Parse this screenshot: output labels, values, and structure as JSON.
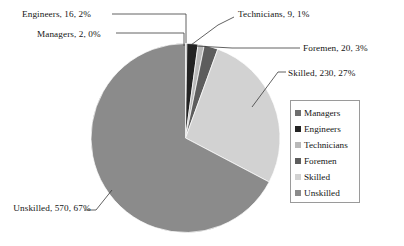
{
  "chart_data": {
    "type": "pie",
    "title": "",
    "categories": [
      "Managers",
      "Engineers",
      "Technicians",
      "Foremen",
      "Skilled",
      "Unskilled"
    ],
    "values": [
      2,
      16,
      9,
      20,
      230,
      570
    ],
    "percents": [
      0,
      2,
      1,
      3,
      27,
      67
    ],
    "total": 847,
    "legend_position": "right",
    "grid": false,
    "start_angle_deg": 0,
    "direction": "clockwise",
    "colors": [
      "#6e6e6e",
      "#232323",
      "#b9b9b9",
      "#5d5d5d",
      "#d2d2d2",
      "#8b8b8b"
    ],
    "slices": [
      {
        "name": "Managers",
        "value": 2,
        "percent": 0,
        "color": "#6e6e6e"
      },
      {
        "name": "Engineers",
        "value": 16,
        "percent": 2,
        "color": "#232323"
      },
      {
        "name": "Technicians",
        "value": 9,
        "percent": 1,
        "color": "#b9b9b9"
      },
      {
        "name": "Foremen",
        "value": 20,
        "percent": 3,
        "color": "#5d5d5d"
      },
      {
        "name": "Skilled",
        "value": 230,
        "percent": 27,
        "color": "#d2d2d2"
      },
      {
        "name": "Unskilled",
        "value": 570,
        "percent": 67,
        "color": "#8b8b8b"
      }
    ]
  },
  "callouts": {
    "engineers": "Engineers, 16, 2%",
    "managers": "Managers, 2, 0%",
    "technicians": "Technicians, 9, 1%",
    "foremen": "Foremen, 20, 3%",
    "skilled": "Skilled, 230, 27%",
    "unskilled": "Unskilled, 570, 67%"
  },
  "legend": {
    "items": [
      {
        "label": "Managers",
        "color": "#6e6e6e"
      },
      {
        "label": "Engineers",
        "color": "#232323"
      },
      {
        "label": "Technicians",
        "color": "#b9b9b9"
      },
      {
        "label": "Foremen",
        "color": "#5d5d5d"
      },
      {
        "label": "Skilled",
        "color": "#d2d2d2"
      },
      {
        "label": "Unskilled",
        "color": "#8b8b8b"
      }
    ]
  },
  "style": {
    "leader_line_color": "#3a3a3a",
    "slice_border_color": "#ffffff",
    "legend_border_color": "#9a9a9a"
  }
}
